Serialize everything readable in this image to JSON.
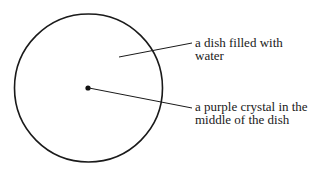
{
  "diagram": {
    "dish": {
      "cx": 88.5,
      "cy": 88,
      "r": 74,
      "stroke": "#1a1a1a"
    },
    "crystal": {
      "cx": 88,
      "cy": 88,
      "r": 2.5,
      "fill": "#111111"
    },
    "labels": [
      {
        "id": "dish",
        "lines": [
          "a dish filled with",
          "water"
        ]
      },
      {
        "id": "crystal",
        "lines": [
          "a purple crystal in the",
          "middle of the dish"
        ]
      }
    ]
  }
}
